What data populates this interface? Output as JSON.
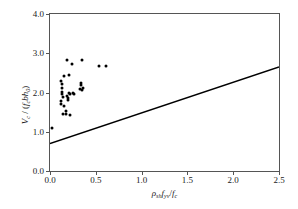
{
  "chart_data": {
    "type": "scatter",
    "title": "",
    "xlabel": "rho_sh f_yv / f_c",
    "ylabel": "V_c / ( f_c b h_0 )",
    "xlim": [
      0.0,
      2.5
    ],
    "ylim": [
      0.0,
      4.0
    ],
    "xticks": [
      0.0,
      0.5,
      1.0,
      1.5,
      2.0,
      2.5
    ],
    "yticks": [
      0.0,
      1.0,
      2.0,
      3.0,
      4.0
    ],
    "xtick_labels": [
      "0.0",
      "0.5",
      "1.0",
      "1.5",
      "2.0",
      "2.5"
    ],
    "ytick_labels": [
      "0.0",
      "1.0",
      "2.0",
      "3.0",
      "4.0"
    ],
    "grid": false,
    "legend": "none",
    "series": [
      {
        "name": "test data",
        "marker": "filled-circle",
        "color": "#000000",
        "points": [
          [
            0.025,
            1.1
          ],
          [
            0.115,
            1.7
          ],
          [
            0.12,
            1.78
          ],
          [
            0.125,
            2.3
          ],
          [
            0.128,
            2.22
          ],
          [
            0.13,
            2.12
          ],
          [
            0.132,
            2.02
          ],
          [
            0.135,
            1.96
          ],
          [
            0.138,
            1.88
          ],
          [
            0.14,
            1.44
          ],
          [
            0.15,
            2.42
          ],
          [
            0.155,
            1.66
          ],
          [
            0.175,
            1.54
          ],
          [
            0.18,
            1.44
          ],
          [
            0.185,
            1.9
          ],
          [
            0.19,
            2.84
          ],
          [
            0.195,
            1.86
          ],
          [
            0.2,
            1.8
          ],
          [
            0.205,
            1.98
          ],
          [
            0.21,
            2.44
          ],
          [
            0.215,
            1.42
          ],
          [
            0.22,
            1.96
          ],
          [
            0.24,
            2.72
          ],
          [
            0.25,
            2.0
          ],
          [
            0.26,
            1.96
          ],
          [
            0.33,
            2.1
          ],
          [
            0.335,
            2.18
          ],
          [
            0.34,
            2.24
          ],
          [
            0.345,
            2.06
          ],
          [
            0.35,
            2.84
          ],
          [
            0.355,
            2.12
          ],
          [
            0.53,
            2.67
          ],
          [
            0.61,
            2.67
          ]
        ]
      }
    ],
    "fit_line": {
      "name": "design equation",
      "intercept": 0.7,
      "slope": 0.78,
      "x_start": 0.0,
      "x_end": 2.5,
      "y_start": 0.7,
      "y_end": 2.65,
      "color": "#000000"
    },
    "annotation": {
      "text": "V_c / ( f_c b h_0 ) = 0.7 + rho_sh f_yv / f_c",
      "leader_from": [
        152,
        130
      ],
      "leader_to": [
        128,
        112
      ]
    }
  },
  "axes": {
    "y_tick_labels": [
      "4.0",
      "3.0",
      "2.0",
      "1.0",
      "0.0"
    ],
    "y_tick_values": [
      4.0,
      3.0,
      2.0,
      1.0,
      0.0
    ],
    "x_tick_labels": [
      "0.0",
      "0.5",
      "1.0",
      "1.5",
      "2.0",
      "2.5"
    ],
    "x_tick_values": [
      0.0,
      0.5,
      1.0,
      1.5,
      2.0,
      2.5
    ]
  },
  "labels": {
    "y_axis_numerator": "V",
    "y_axis_numerator_sub": "c",
    "y_axis_slash": " / ",
    "y_axis_denominator_open": "(",
    "y_axis_f": "f",
    "y_axis_f_sub": "c",
    "y_axis_b": "b",
    "y_axis_h": "h",
    "y_axis_h_sub": "0",
    "y_axis_denominator_close": ")",
    "x_axis_rho": "ρ",
    "x_axis_rho_sub": "sh",
    "x_axis_fyv": "f",
    "x_axis_fyv_sub": "yv",
    "x_axis_slash": "/",
    "x_axis_fc": "f",
    "x_axis_fc_sub": "c",
    "equation_lhs_v": "V",
    "equation_lhs_v_sub": "c",
    "equation_slash": " / ",
    "equation_open": "(",
    "equation_f": "f",
    "equation_f_sub": "c",
    "equation_b": "b",
    "equation_h": "h",
    "equation_h_sub": "0",
    "equation_close": ")",
    "equation_equals": " =0.7+",
    "equation_rho": "ρ",
    "equation_rho_sub": "sh",
    "equation_fyv": "f",
    "equation_fyv_sub": "yv",
    "equation_div": "/",
    "equation_fc": "f",
    "equation_fc_sub": "c"
  },
  "style": {
    "frame_color": "#555555",
    "marker_color": "#000000",
    "line_color": "#000000",
    "text_color": "#1a1a1a",
    "background": "#ffffff"
  }
}
